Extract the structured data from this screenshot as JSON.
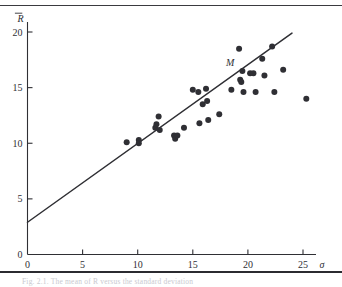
{
  "figure": {
    "caption_text": "Fig. 2.1.  The mean of R versus the standard deviation",
    "plot_bg": "#ffffff",
    "ink_color": "#2f2f34",
    "rule_color": "#3a3a3f"
  },
  "axes": {
    "x": {
      "label": "σ",
      "ticks": [
        0,
        5,
        10,
        15,
        20,
        25
      ],
      "tick_labels": [
        "0",
        "5",
        "10",
        "15",
        "20",
        "25"
      ],
      "min": 0,
      "max": 27.3
    },
    "y": {
      "label": "R̄",
      "label_base": "R",
      "ticks": [
        0,
        5,
        10,
        15,
        20
      ],
      "tick_labels": [
        "0",
        "5",
        "10",
        "15",
        "20"
      ],
      "min": 0,
      "max": 21.3
    }
  },
  "annotations": [
    {
      "text": "M",
      "x": 18.4,
      "y": 16.9
    }
  ],
  "chart_data": {
    "type": "scatter",
    "title": "",
    "xlabel": "σ",
    "ylabel": "R̄",
    "xlim": [
      0,
      27.3
    ],
    "ylim": [
      0,
      21.3
    ],
    "grid": false,
    "legend": "none",
    "marker": "filled-circle",
    "marker_radius_px": 3.0,
    "points": [
      {
        "x": 9.0,
        "y": 10.1
      },
      {
        "x": 10.1,
        "y": 10.3
      },
      {
        "x": 10.1,
        "y": 10.0
      },
      {
        "x": 11.6,
        "y": 11.4
      },
      {
        "x": 11.7,
        "y": 11.7
      },
      {
        "x": 11.9,
        "y": 12.4
      },
      {
        "x": 12.0,
        "y": 11.2
      },
      {
        "x": 13.3,
        "y": 10.7
      },
      {
        "x": 13.4,
        "y": 10.4
      },
      {
        "x": 13.6,
        "y": 10.7
      },
      {
        "x": 14.2,
        "y": 11.4
      },
      {
        "x": 15.0,
        "y": 14.8
      },
      {
        "x": 15.5,
        "y": 14.6
      },
      {
        "x": 15.6,
        "y": 11.8
      },
      {
        "x": 15.9,
        "y": 13.5
      },
      {
        "x": 16.2,
        "y": 14.9
      },
      {
        "x": 16.3,
        "y": 13.8
      },
      {
        "x": 16.4,
        "y": 12.1
      },
      {
        "x": 17.4,
        "y": 12.6
      },
      {
        "x": 18.5,
        "y": 14.8
      },
      {
        "x": 19.2,
        "y": 18.5
      },
      {
        "x": 19.3,
        "y": 15.7
      },
      {
        "x": 19.4,
        "y": 15.5
      },
      {
        "x": 19.5,
        "y": 16.5
      },
      {
        "x": 19.6,
        "y": 14.6
      },
      {
        "x": 20.2,
        "y": 16.3
      },
      {
        "x": 20.5,
        "y": 16.3
      },
      {
        "x": 20.7,
        "y": 14.6
      },
      {
        "x": 21.3,
        "y": 17.6
      },
      {
        "x": 21.5,
        "y": 16.1
      },
      {
        "x": 22.2,
        "y": 18.7
      },
      {
        "x": 22.4,
        "y": 14.6
      },
      {
        "x": 23.2,
        "y": 16.6
      },
      {
        "x": 25.3,
        "y": 14.0
      }
    ],
    "fit_line": {
      "label": "regression-line",
      "x1": 0.0,
      "y1": 2.9,
      "x2": 24.0,
      "y2": 19.9,
      "slope": 0.708,
      "intercept": 2.9
    }
  }
}
